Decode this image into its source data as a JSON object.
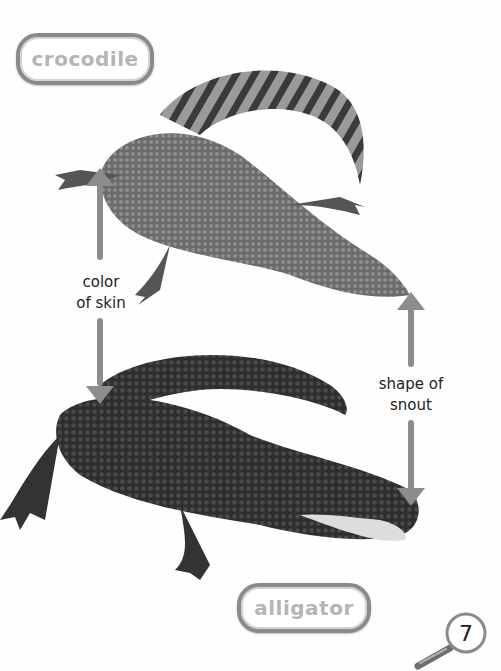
{
  "page": {
    "labels": {
      "top_animal": "crocodile",
      "bottom_animal": "alligator"
    },
    "captions": {
      "skin": [
        "color",
        "of skin"
      ],
      "snout": [
        "shape of",
        "snout"
      ]
    },
    "page_number": "7",
    "icons": {
      "page_badge": "magnifying-glass-icon"
    },
    "colors": {
      "arrow": "#8c8c8c",
      "label_border": "#8a8a8a",
      "label_text": "#b5b5b5"
    }
  }
}
